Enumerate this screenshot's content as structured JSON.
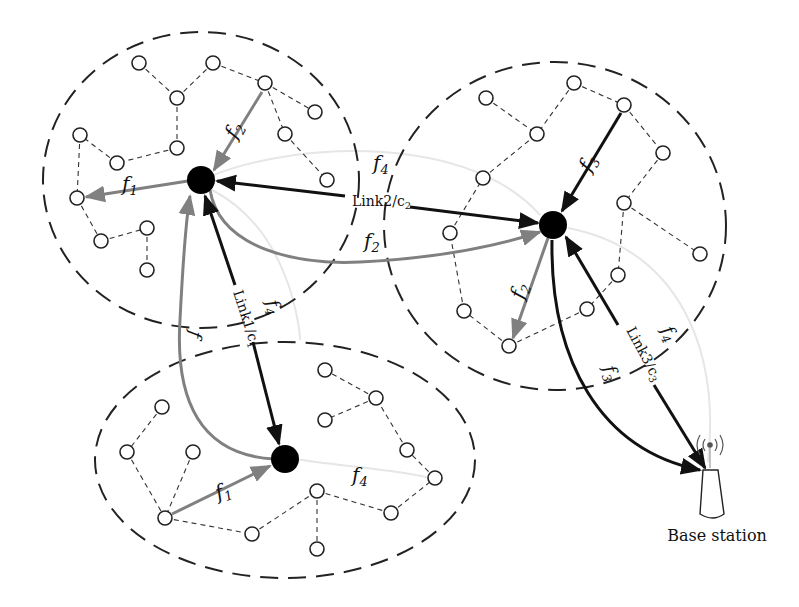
{
  "diagram": {
    "title": "",
    "colors": {
      "background": "#ffffff",
      "node_stroke": "#222222",
      "hub_fill": "#000000",
      "dashed_edge": "#333333",
      "cluster_boundary": "#222222",
      "link_arrow": "#111111",
      "flow_gray": "#7f7f7f",
      "flow_faint": "#e4e4e4"
    },
    "clusters": [
      {
        "id": "cluster-top-left",
        "shape": "ellipse",
        "cx": 201,
        "cy": 180,
        "rx": 158,
        "ry": 148
      },
      {
        "id": "cluster-right",
        "shape": "ellipse",
        "cx": 555,
        "cy": 226,
        "rx": 171,
        "ry": 164
      },
      {
        "id": "cluster-bottom",
        "shape": "ellipse",
        "cx": 285,
        "cy": 460,
        "rx": 190,
        "ry": 118
      }
    ],
    "hubs": [
      {
        "id": "hub-top-left",
        "x": 201,
        "y": 180
      },
      {
        "id": "hub-right",
        "x": 553,
        "y": 225
      },
      {
        "id": "hub-bottom",
        "x": 285,
        "y": 459
      }
    ],
    "labels": {
      "link1": "Link1/c",
      "link1_sub": "1",
      "link2": "Link2/c",
      "link2_sub": "2",
      "link3": "Link3/c",
      "link3_sub": "3",
      "f": "f",
      "f1_sub": "1",
      "f2_sub": "2",
      "f3_sub": "3",
      "f4_sub": "4",
      "base_station": "Base station"
    }
  }
}
